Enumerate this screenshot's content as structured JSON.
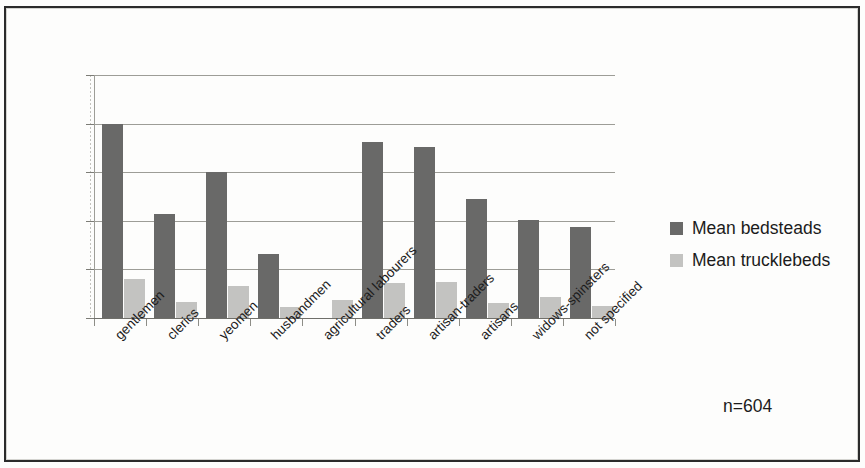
{
  "annotations": {
    "sample_size": "n=604",
    "smudge_1": "",
    "smudge_2": "",
    "smudge_3": ""
  },
  "legend": {
    "position": "right",
    "items": [
      {
        "label": "Mean bedsteads",
        "color": "#696968"
      },
      {
        "label": "Mean trucklebeds",
        "color": "#c3c3c1"
      }
    ]
  },
  "axis": {
    "y_ticks": [
      "0",
      "1",
      "2",
      "3",
      "4",
      "5"
    ]
  },
  "chart_data": {
    "type": "bar",
    "title": "",
    "subtitle": "",
    "xlabel": "",
    "ylabel": "",
    "ylim": [
      0,
      5
    ],
    "grid": true,
    "legend_position": "right",
    "annotation": "n=604",
    "categories": [
      "gentlemen",
      "clerics",
      "yeomen",
      "husbandmen",
      "agricultural labourers",
      "traders",
      "artisan-traders",
      "artisans",
      "widows-spinsters",
      "not specified"
    ],
    "series": [
      {
        "name": "Mean bedsteads",
        "color": "#696968",
        "values": [
          4.0,
          2.15,
          3.0,
          1.32,
          0,
          3.62,
          3.52,
          2.44,
          2.02,
          1.88
        ]
      },
      {
        "name": "Mean trucklebeds",
        "color": "#c3c3c1",
        "values": [
          0.8,
          0.33,
          0.65,
          0.22,
          0.38,
          0.73,
          0.74,
          0.3,
          0.44,
          0.24
        ]
      }
    ]
  }
}
